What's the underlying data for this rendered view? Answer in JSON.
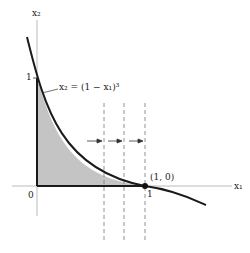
{
  "axes": {
    "x_label": "x₁",
    "y_label": "x₂",
    "origin_label": "0",
    "x_tick_label": "1",
    "y_tick_label": "1"
  },
  "curve": {
    "equation": "x₂ = (1 − x₁)³"
  },
  "point": {
    "label": "(1, 0)"
  },
  "colors": {
    "shade": "#bdbdbd",
    "curve": "#1a1a1a",
    "axis": "#999999",
    "dashed": "#777777"
  }
}
